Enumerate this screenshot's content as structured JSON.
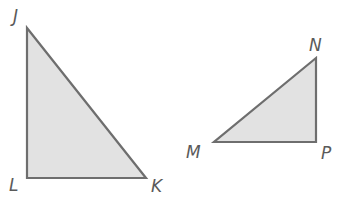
{
  "diagram": {
    "type": "geometry",
    "colors": {
      "fill": "#e2e2e2",
      "stroke": "#6e6e6e",
      "label": "#5a5a5a"
    },
    "triangles": [
      {
        "name": "triangle-JLK",
        "right_angle_at": "L",
        "vertices": [
          {
            "label": "J",
            "x": 27,
            "y": 28,
            "label_x": 13,
            "label_y": 22
          },
          {
            "label": "L",
            "x": 27,
            "y": 178,
            "label_x": 9,
            "label_y": 191
          },
          {
            "label": "K",
            "x": 146,
            "y": 178,
            "label_x": 151,
            "label_y": 192
          }
        ]
      },
      {
        "name": "triangle-MNP",
        "right_angle_at": "P",
        "vertices": [
          {
            "label": "N",
            "x": 316,
            "y": 58,
            "label_x": 309,
            "label_y": 51
          },
          {
            "label": "M",
            "x": 214,
            "y": 142,
            "label_x": 186,
            "label_y": 158
          },
          {
            "label": "P",
            "x": 316,
            "y": 142,
            "label_x": 321,
            "label_y": 159
          }
        ]
      }
    ]
  }
}
